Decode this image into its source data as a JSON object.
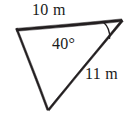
{
  "figure": {
    "type": "triangle-diagram",
    "background_color": "#ffffff",
    "stroke_color": "#231f20",
    "text_color": "#1a1a1a",
    "labels": {
      "side_top": "10 m",
      "side_right": "11 m",
      "angle": "40°"
    },
    "geometry": {
      "vertices": {
        "left": [
          16,
          29
        ],
        "right": [
          122,
          20
        ],
        "bottom": [
          48,
          110
        ]
      },
      "angle_arc": {
        "at_vertex": "right",
        "radius": 20,
        "measure_degrees": 40
      }
    },
    "measurements": [
      {
        "name": "top-side",
        "value": 10,
        "unit": "m",
        "between": [
          "left",
          "right"
        ]
      },
      {
        "name": "right-side",
        "value": 11,
        "unit": "m",
        "between": [
          "bottom",
          "right"
        ]
      },
      {
        "name": "included-angle",
        "value": 40,
        "unit": "°",
        "at": "right"
      }
    ]
  }
}
